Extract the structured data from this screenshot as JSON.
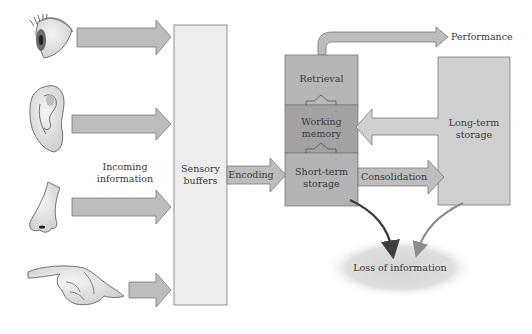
{
  "diagram": {
    "type": "memory-flow-model",
    "colors": {
      "arrow_fill": "#bdbdbd",
      "arrow_stroke": "#7a7a7a",
      "sensory_buffer_fill": "#ededed",
      "retrieval_fill": "#b6b6b6",
      "working_memory_fill": "#a2a2a2",
      "short_term_fill": "#b3b3b3",
      "long_term_fill": "#cfcfcf",
      "loss_cloud_fill": "#dcdcdc",
      "dark_curve": "#3d3d3d",
      "light_curve": "#8c8c8c",
      "text": "#3a3a3a"
    },
    "senses": [
      {
        "name": "eye",
        "icon": "eye-icon"
      },
      {
        "name": "ear",
        "icon": "ear-icon"
      },
      {
        "name": "nose",
        "icon": "nose-icon"
      },
      {
        "name": "finger",
        "icon": "pointing-hand-icon"
      }
    ],
    "labels": {
      "incoming_line1": "Incoming",
      "incoming_line2": "information",
      "sensory_line1": "Sensory",
      "sensory_line2": "buffers",
      "encoding": "Encoding",
      "retrieval": "Retrieval",
      "working_line1": "Working",
      "working_line2": "memory",
      "short_term_line1": "Short-term",
      "short_term_line2": "storage",
      "consolidation": "Consolidation",
      "long_term_line1": "Long-term",
      "long_term_line2": "storage",
      "performance": "Performance",
      "loss": "Loss of information"
    }
  }
}
